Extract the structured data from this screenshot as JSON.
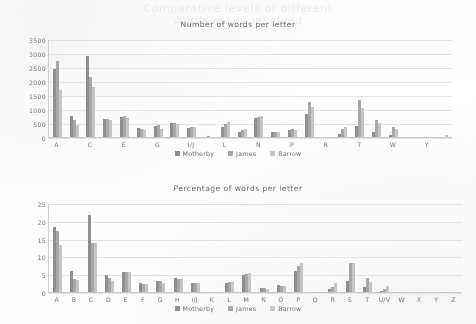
{
  "page": {
    "ghost_line_1": "Comparative levels of different",
    "ghost_line_2": "words ready involved"
  },
  "legend": {
    "series": [
      {
        "name": "Motherby",
        "color": "#8f8f8f"
      },
      {
        "name": "James",
        "color": "#a8a8a8"
      },
      {
        "name": "Barrow",
        "color": "#c6c6c6"
      }
    ]
  },
  "chart_data": [
    {
      "type": "bar",
      "title": "Number of words per letter",
      "xlabel": "",
      "ylabel": "",
      "ylim": [
        0,
        3500
      ],
      "yticks": [
        0,
        500,
        1000,
        1500,
        2000,
        2500,
        3000,
        3500
      ],
      "grid": true,
      "legend_position": "bottom",
      "categories": [
        "A",
        "B",
        "C",
        "D",
        "E",
        "F",
        "G",
        "H",
        "I/J",
        "K",
        "L",
        "M",
        "N",
        "O",
        "P",
        "Q",
        "R",
        "S",
        "T",
        "U/V",
        "W",
        "X",
        "Y",
        "Z"
      ],
      "xtick_labels": [
        "A",
        "",
        "C",
        "",
        "E",
        "",
        "G",
        "",
        "I/J",
        "",
        "L",
        "",
        "N",
        "",
        "P",
        "",
        "R",
        "",
        "T",
        "",
        "W",
        "",
        "Y",
        ""
      ],
      "series": [
        {
          "name": "Motherby",
          "values": [
            2470,
            800,
            2920,
            690,
            760,
            360,
            440,
            540,
            370,
            50,
            400,
            230,
            700,
            215,
            300,
            840,
            20,
            140,
            440,
            230,
            100,
            10,
            15,
            10
          ]
        },
        {
          "name": "James",
          "values": [
            2740,
            640,
            2170,
            680,
            770,
            320,
            450,
            540,
            400,
            60,
            490,
            280,
            760,
            225,
            320,
            1290,
            30,
            310,
            1350,
            650,
            380,
            15,
            20,
            30
          ]
        },
        {
          "name": "Barrow",
          "values": [
            1710,
            460,
            1820,
            640,
            730,
            270,
            330,
            500,
            390,
            40,
            560,
            310,
            790,
            200,
            300,
            1100,
            25,
            400,
            1080,
            540,
            310,
            10,
            25,
            90
          ]
        }
      ]
    },
    {
      "type": "bar",
      "title": "Percentage of words per letter",
      "xlabel": "",
      "ylabel": "",
      "ylim": [
        0,
        25
      ],
      "yticks": [
        0,
        5,
        10,
        15,
        20,
        25
      ],
      "grid": true,
      "legend_position": "bottom",
      "categories": [
        "A",
        "B",
        "C",
        "D",
        "E",
        "F",
        "G",
        "H",
        "I/J",
        "K",
        "L",
        "M",
        "N",
        "O",
        "P",
        "Q",
        "R",
        "S",
        "T",
        "U/V",
        "W",
        "X",
        "Y",
        "Z"
      ],
      "xtick_labels": [
        "A",
        "B",
        "C",
        "D",
        "E",
        "F",
        "G",
        "H",
        "I/J",
        "K",
        "L",
        "M",
        "N",
        "O",
        "P",
        "Q",
        "R",
        "S",
        "T",
        "U/V",
        "W",
        "X",
        "Y",
        "Z"
      ],
      "series": [
        {
          "name": "Motherby",
          "values": [
            18.6,
            6.2,
            22.0,
            5.1,
            6.0,
            2.9,
            3.5,
            4.2,
            2.8,
            0.4,
            2.7,
            5.0,
            1.4,
            2.2,
            6.3,
            0.2,
            1.1,
            3.3,
            1.7,
            0.6,
            0.15,
            0.1,
            0.1,
            0.1
          ]
        },
        {
          "name": "James",
          "values": [
            17.3,
            4.0,
            14.0,
            4.2,
            6.0,
            2.6,
            3.3,
            4.0,
            2.7,
            0.4,
            3.0,
            5.3,
            1.3,
            2.1,
            7.6,
            0.2,
            1.6,
            8.4,
            4.1,
            1.1,
            0.2,
            0.1,
            0.1,
            0.2
          ]
        },
        {
          "name": "Barrow",
          "values": [
            13.6,
            3.6,
            14.1,
            3.5,
            5.9,
            2.4,
            2.7,
            3.8,
            2.9,
            0.3,
            3.2,
            5.7,
            1.2,
            2.1,
            8.3,
            0.2,
            2.8,
            8.4,
            3.2,
            2.1,
            0.15,
            0.1,
            0.1,
            0.3
          ]
        }
      ]
    }
  ]
}
